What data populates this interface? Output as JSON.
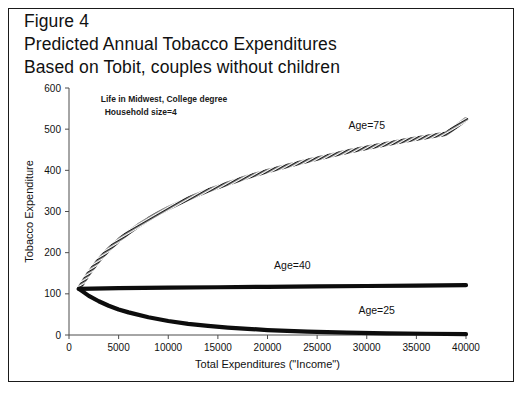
{
  "figure": {
    "title_lines": [
      "Figure 4",
      "Predicted Annual Tobacco Expenditures",
      "Based on Tobit, couples without children"
    ]
  },
  "chart_data": {
    "type": "line",
    "title": "Predicted Annual Tobacco Expenditures Based on Tobit, couples without children",
    "xlabel": "Total Expenditures (\"Income\")",
    "ylabel": "Tobacco Expenditure",
    "xlim": [
      0,
      40000
    ],
    "ylim": [
      0,
      600
    ],
    "xticks": [
      0,
      5000,
      10000,
      15000,
      20000,
      25000,
      30000,
      35000,
      40000
    ],
    "xtick_labels": [
      "0",
      "5000",
      "10000",
      "15000",
      "20000",
      "25000",
      "30000",
      "35000",
      "40000"
    ],
    "yticks": [
      0,
      100,
      200,
      300,
      400,
      500,
      600
    ],
    "ytick_labels": [
      "0",
      "100",
      "200",
      "300",
      "400",
      "500",
      "600"
    ],
    "grid": false,
    "legend_position": "inline-annotations",
    "annotations": [
      {
        "name": "note-line-1",
        "text": "Life in Midwest, College degree",
        "x": 3200,
        "y": 565
      },
      {
        "name": "note-line-2",
        "text": "Household size=4",
        "x": 3600,
        "y": 535
      }
    ],
    "series": [
      {
        "name": "Age=75",
        "label": "Age=75",
        "style": "hatched",
        "label_x": 30000,
        "label_y": 500,
        "x": [
          1000,
          2000,
          3000,
          4000,
          5000,
          6000,
          7000,
          8000,
          9000,
          10000,
          12000,
          14000,
          16000,
          18000,
          20000,
          22000,
          24000,
          26000,
          28000,
          30000,
          32000,
          34000,
          36000,
          38000,
          40000
        ],
        "y": [
          112,
          150,
          182,
          208,
          230,
          249,
          266,
          281,
          295,
          308,
          331,
          351,
          368,
          384,
          398,
          411,
          423,
          434,
          445,
          455,
          464,
          473,
          481,
          489,
          524
        ]
      },
      {
        "name": "Age=40",
        "label": "Age=40",
        "style": "thick-solid",
        "label_x": 22500,
        "label_y": 160,
        "x": [
          1000,
          5000,
          10000,
          15000,
          20000,
          25000,
          30000,
          35000,
          40000
        ],
        "y": [
          112,
          114,
          115,
          116,
          117,
          118,
          119,
          120,
          121
        ]
      },
      {
        "name": "Age=25",
        "label": "Age=25",
        "style": "thick-solid",
        "label_x": 31000,
        "label_y": 52,
        "x": [
          1000,
          2000,
          3000,
          4000,
          5000,
          6000,
          8000,
          10000,
          12000,
          14000,
          16000,
          18000,
          20000,
          24000,
          28000,
          32000,
          36000,
          40000
        ],
        "y": [
          112,
          95,
          82,
          71,
          62,
          55,
          43,
          34,
          27,
          22,
          18,
          15,
          12,
          8,
          6,
          4,
          3,
          2
        ]
      }
    ]
  }
}
